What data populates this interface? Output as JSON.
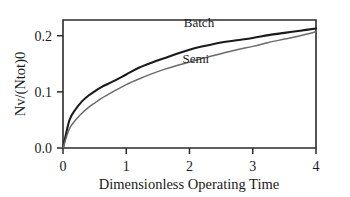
{
  "chart_data": {
    "type": "line",
    "title": "",
    "xlabel": "Dimensionless Operating Time",
    "ylabel": "Nv/(Ntot)0",
    "xlim": [
      0,
      4
    ],
    "ylim": [
      0,
      0.228
    ],
    "xticks": [
      0,
      1,
      2,
      3,
      4
    ],
    "xtick_labels": [
      "0",
      "1",
      "2",
      "3",
      "4"
    ],
    "yticks": [
      0.0,
      0.1,
      0.2
    ],
    "ytick_labels": [
      "0.0",
      "0.1",
      "0.2"
    ],
    "grid": false,
    "legend_position": "inline-annotations",
    "frame": "box",
    "background": "#ffffff",
    "x": [
      0,
      0.1,
      0.2,
      0.3,
      0.4,
      0.5,
      0.6,
      0.8,
      1.0,
      1.2,
      1.4,
      1.6,
      1.8,
      2.0,
      2.25,
      2.5,
      2.75,
      3.0,
      3.25,
      3.5,
      3.75,
      4.0
    ],
    "series": [
      {
        "name": "Batch",
        "color": "#1a1a1a",
        "line_width": 2.1,
        "label_x": 2.15,
        "label_y": 0.216,
        "values": [
          0.0,
          0.049,
          0.069,
          0.083,
          0.093,
          0.101,
          0.108,
          0.119,
          0.131,
          0.143,
          0.152,
          0.16,
          0.168,
          0.175,
          0.182,
          0.188,
          0.192,
          0.196,
          0.201,
          0.205,
          0.209,
          0.213
        ]
      },
      {
        "name": "Semi",
        "color": "#6b6b6b",
        "line_width": 1.5,
        "label_x": 2.1,
        "label_y": 0.152,
        "values": [
          0.0,
          0.034,
          0.05,
          0.062,
          0.072,
          0.08,
          0.088,
          0.101,
          0.113,
          0.123,
          0.132,
          0.14,
          0.147,
          0.153,
          0.161,
          0.168,
          0.175,
          0.181,
          0.188,
          0.194,
          0.2,
          0.207
        ]
      }
    ]
  }
}
